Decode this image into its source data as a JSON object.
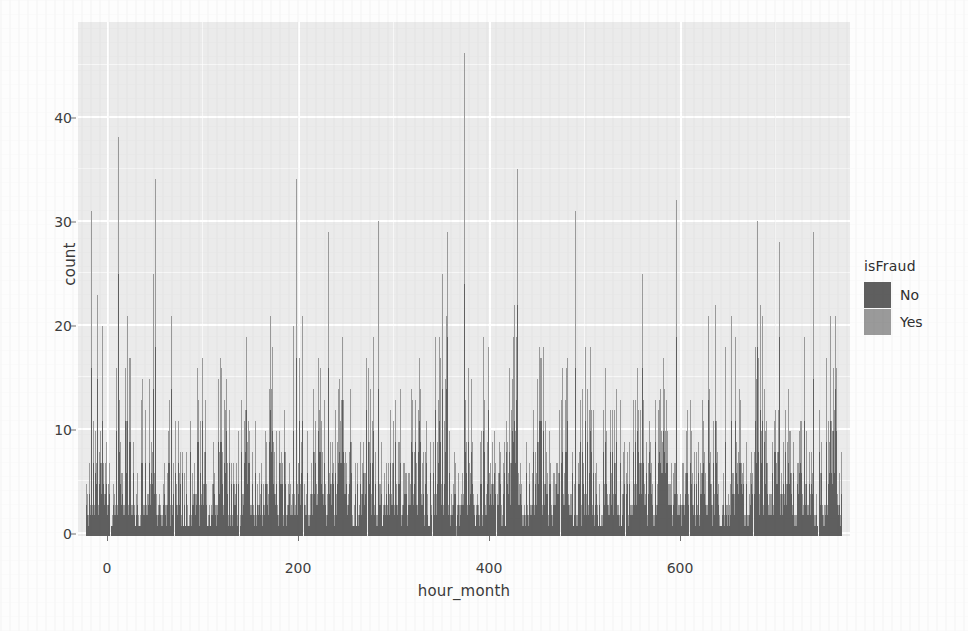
{
  "chart_data": {
    "type": "bar",
    "subtype": "stacked-bar-histogram",
    "title": "",
    "subtitle": "",
    "xlabel": "hour_month",
    "ylabel": "count",
    "xlim": [
      -8,
      752
    ],
    "ylim": [
      0,
      49
    ],
    "x_ticks": [
      0,
      200,
      400,
      600
    ],
    "y_ticks": [
      0,
      10,
      20,
      30,
      40
    ],
    "grid": true,
    "panel_background": "#ebebeb",
    "gridline_color": "#ffffff",
    "legend": {
      "title": "isFraud",
      "position": "right",
      "entries": [
        {
          "label": "No",
          "color": "#5f5f5f"
        },
        {
          "label": "Yes",
          "color": "#9a9a9a"
        }
      ]
    },
    "bar_width_hours": 1,
    "x_unit": "hour of month",
    "n_bars": 744,
    "peaks": [
      {
        "x": 372,
        "total": 46
      },
      {
        "x": 31,
        "total": 38
      },
      {
        "x": 424,
        "total": 35
      },
      {
        "x": 68,
        "total": 34
      },
      {
        "x": 207,
        "total": 34
      },
      {
        "x": 581,
        "total": 32
      },
      {
        "x": 5,
        "total": 31
      },
      {
        "x": 481,
        "total": 31
      },
      {
        "x": 287,
        "total": 30
      },
      {
        "x": 660,
        "total": 30
      },
      {
        "x": 716,
        "total": 29
      },
      {
        "x": 238,
        "total": 29
      },
      {
        "x": 355,
        "total": 29
      }
    ],
    "series": [
      {
        "name": "No",
        "color": "#5f5f5f",
        "stack_order": 1,
        "approx_mean": 8.6
      },
      {
        "name": "Yes",
        "color": "#9a9a9a",
        "stack_order": 2,
        "approx_mean": 5.4
      }
    ],
    "categories_label": "hour_month",
    "totals_summary": {
      "min": 0,
      "max": 46,
      "typical_range": [
        4,
        22
      ]
    }
  },
  "axes": {
    "y": {
      "label": "count",
      "ticks": [
        {
          "value": 40,
          "label": "40"
        },
        {
          "value": 30,
          "label": "30"
        },
        {
          "value": 20,
          "label": "20"
        },
        {
          "value": 10,
          "label": "10"
        },
        {
          "value": 0,
          "label": "0"
        }
      ]
    },
    "x": {
      "label": "hour_month",
      "ticks": [
        {
          "value": 0,
          "label": "0"
        },
        {
          "value": 200,
          "label": "200"
        },
        {
          "value": 400,
          "label": "400"
        },
        {
          "value": 600,
          "label": "600"
        }
      ]
    }
  },
  "legend": {
    "title": "isFraud",
    "items": [
      {
        "label": "No",
        "color": "#5f5f5f"
      },
      {
        "label": "Yes",
        "color": "#9a9a9a"
      }
    ]
  }
}
